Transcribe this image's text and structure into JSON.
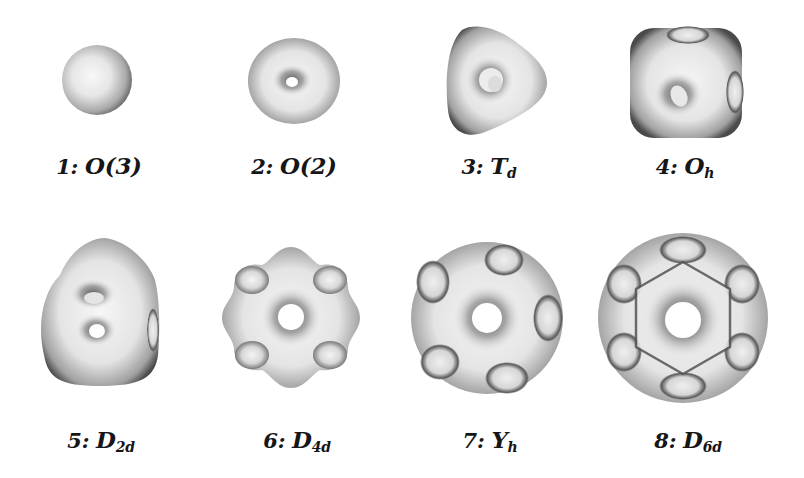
{
  "figure": {
    "type": "symmetry-shapes-grid",
    "colors": {
      "background": "#ffffff",
      "surface_light": "#f4f4f4",
      "surface_mid": "#b8b8b8",
      "surface_dark": "#3a3a3a",
      "label": "#161616"
    },
    "items": [
      {
        "index": "1",
        "sep": ":",
        "symbol": "O(3)",
        "subscript": "",
        "shape": "sphere"
      },
      {
        "index": "2",
        "sep": ":",
        "symbol": "O(2)",
        "subscript": "",
        "shape": "torus"
      },
      {
        "index": "3",
        "sep": ":",
        "symbol": "T",
        "subscript": "d",
        "shape": "tetrahedral"
      },
      {
        "index": "4",
        "sep": ":",
        "symbol": "O",
        "subscript": "h",
        "shape": "octahedral-cube"
      },
      {
        "index": "5",
        "sep": ":",
        "symbol": "D",
        "subscript": "2d",
        "shape": "dihedral-2d"
      },
      {
        "index": "6",
        "sep": ":",
        "symbol": "D",
        "subscript": "4d",
        "shape": "dihedral-4d"
      },
      {
        "index": "7",
        "sep": ":",
        "symbol": "Y",
        "subscript": "h",
        "shape": "icosahedral"
      },
      {
        "index": "8",
        "sep": ":",
        "symbol": "D",
        "subscript": "6d",
        "shape": "dihedral-6d"
      }
    ]
  }
}
